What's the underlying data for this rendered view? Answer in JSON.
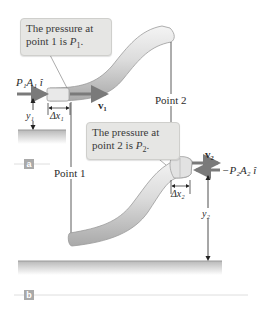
{
  "figure": {
    "colors": {
      "tube_fill": "#d9d9d9",
      "tube_highlight": "#f2f2f2",
      "tube_shadow": "#a8a8a8",
      "callout_bg": "#e6e6e4",
      "arrow": "#7a7a7a",
      "line": "#333333",
      "ground": "#cfcfcf",
      "panel_tag": "#a9a9a9"
    },
    "callout_1": {
      "line1": "The pressure at",
      "line2_prefix": "point 1 is ",
      "line2_var": "P",
      "line2_sub": "1",
      "line2_suffix": "."
    },
    "callout_2": {
      "line1": "The pressure at",
      "line2_prefix": "point 2 is ",
      "line2_var": "P",
      "line2_sub": "2",
      "line2_suffix": "."
    },
    "labels": {
      "force1": "P₁A₁ î",
      "force2": "−P₂A₂ î",
      "v1": "v₁",
      "v2": "v₂",
      "dx1": "Δx₁",
      "dx2": "Δx₂",
      "y1": "y₁",
      "y2": "y₂",
      "point1": "Point 1",
      "point2": "Point 2"
    },
    "panels": [
      "a",
      "b"
    ]
  }
}
